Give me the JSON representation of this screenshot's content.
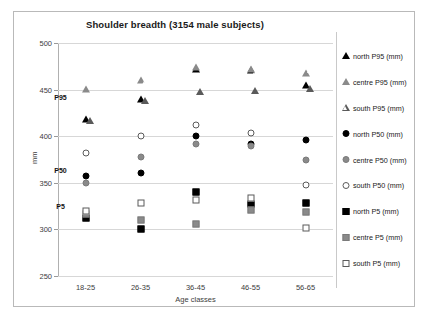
{
  "chart_data": {
    "type": "scatter",
    "title": "Shoulder breadth (3154 male subjects)",
    "xlabel": "Age classes",
    "ylabel": "mm",
    "categories": [
      "18-25",
      "26-35",
      "36-45",
      "46-55",
      "56-65"
    ],
    "ylim": [
      250,
      500
    ],
    "yticks": [
      250,
      300,
      350,
      400,
      450,
      500
    ],
    "grid": true,
    "legend_position": "right",
    "annotations": [
      {
        "text": "P95",
        "category_index": 0,
        "value": 442
      },
      {
        "text": "P50",
        "category_index": 0,
        "value": 364
      },
      {
        "text": "P5",
        "category_index": 0,
        "value": 325
      }
    ],
    "series": [
      {
        "name": "north P95 (mm)",
        "marker": "triangle",
        "fill": "black",
        "color": "#000000",
        "values": [
          418,
          440,
          472,
          471,
          455
        ]
      },
      {
        "name": "centre P95 (mm)",
        "marker": "triangle",
        "fill": "grey",
        "color": "#8a8a8a",
        "values": [
          451,
          460,
          474,
          472,
          468
        ]
      },
      {
        "name": "south P95 (mm)",
        "marker": "triangle",
        "fill": "open",
        "color": "#5a5a5a",
        "values": [
          429,
          451,
          460,
          461,
          464
        ]
      },
      {
        "name": "north P50 (mm)",
        "marker": "circle",
        "fill": "black",
        "color": "#000000",
        "values": [
          357,
          360,
          400,
          392,
          396
        ]
      },
      {
        "name": "centre P50 (mm)",
        "marker": "circle",
        "fill": "grey",
        "color": "#8a8a8a",
        "values": [
          350,
          378,
          392,
          389,
          375
        ]
      },
      {
        "name": "south P50 (mm)",
        "marker": "circle",
        "fill": "open",
        "color": "#5a5a5a",
        "values": [
          382,
          400,
          412,
          403,
          348
        ]
      },
      {
        "name": "north P5 (mm)",
        "marker": "square",
        "fill": "black",
        "color": "#000000",
        "values": [
          312,
          300,
          340,
          327,
          328
        ]
      },
      {
        "name": "centre P5 (mm)",
        "marker": "square",
        "fill": "grey",
        "color": "#8a8a8a",
        "values": [
          316,
          310,
          306,
          321,
          319
        ]
      },
      {
        "name": "south P5 (mm)",
        "marker": "square",
        "fill": "open",
        "color": "#5a5a5a",
        "values": [
          320,
          328,
          332,
          334,
          301
        ]
      }
    ]
  }
}
